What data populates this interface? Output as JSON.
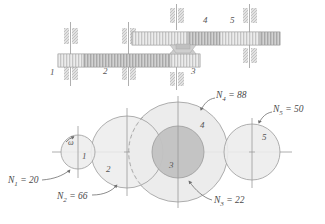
{
  "figure": {
    "colors": {
      "line": "#8d8d8d",
      "axis": "#9a9a9a",
      "fill_light": "#e6e6e6",
      "fill_mid": "#dcdcdc",
      "fill_dark": "#bdbdbd",
      "text": "#4a4a4a",
      "gear_body": "#c9c9c9",
      "shaft": "#d6d6d6"
    }
  },
  "schematic": {
    "name": "gear-train-schematic",
    "gear_labels": [
      {
        "id": "1",
        "text": "1",
        "x": 50,
        "y": 72
      },
      {
        "id": "2",
        "text": "2",
        "x": 103,
        "y": 71
      },
      {
        "id": "3",
        "text": "3",
        "x": 191,
        "y": 71
      },
      {
        "id": "4",
        "text": "4",
        "x": 203,
        "y": 20
      },
      {
        "id": "5",
        "text": "5",
        "x": 230,
        "y": 20
      }
    ]
  },
  "pitch_view": {
    "name": "pitch-circle-view",
    "omega_label": "ω",
    "gear_numbers": [
      {
        "id": "1",
        "text": "1",
        "x": 82,
        "y": 155
      },
      {
        "id": "2",
        "text": "2",
        "x": 106,
        "y": 168
      },
      {
        "id": "3",
        "text": "3",
        "x": 169,
        "y": 164
      },
      {
        "id": "4",
        "text": "4",
        "x": 200,
        "y": 125
      },
      {
        "id": "5",
        "text": "5",
        "x": 262,
        "y": 137
      }
    ],
    "tooth_labels": [
      {
        "id": "N1",
        "prefix": "N",
        "sub": "1",
        "value": "20",
        "text": "N1 = 20",
        "x": 14,
        "y": 182
      },
      {
        "id": "N2",
        "prefix": "N",
        "sub": "2",
        "value": "66",
        "text": "N2 = 66",
        "x": 63,
        "y": 198
      },
      {
        "id": "N3",
        "prefix": "N",
        "sub": "3",
        "value": "22",
        "text": "N3 = 22",
        "x": 215,
        "y": 202
      },
      {
        "id": "N4",
        "prefix": "N",
        "sub": "4",
        "value": "88",
        "text": "N4 = 88",
        "x": 214,
        "y": 96
      },
      {
        "id": "N5",
        "prefix": "N",
        "sub": "5",
        "value": "50",
        "text": "N5 = 50",
        "x": 274,
        "y": 111
      }
    ],
    "circles": [
      {
        "id": "gear-1",
        "cx": 78,
        "cy": 152,
        "r": 17,
        "teeth": 20
      },
      {
        "id": "gear-2",
        "cx": 127,
        "cy": 152,
        "r": 36,
        "teeth": 66
      },
      {
        "id": "gear-4",
        "cx": 178,
        "cy": 152,
        "r": 50,
        "teeth": 88
      },
      {
        "id": "gear-3",
        "cx": 178,
        "cy": 152,
        "r": 26,
        "teeth": 22
      },
      {
        "id": "gear-5",
        "cx": 252,
        "cy": 152,
        "r": 28,
        "teeth": 50
      }
    ]
  }
}
